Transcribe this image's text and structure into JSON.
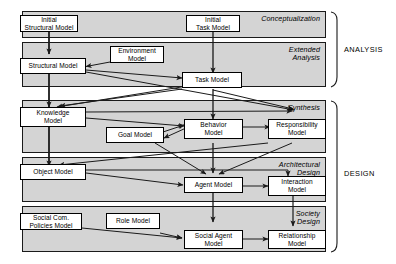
{
  "diagram": {
    "canvas": {
      "width": 396,
      "height": 264
    },
    "colors": {
      "band_fill": "#d4d4d4",
      "band_stroke": "#1a1a1a",
      "node_fill": "#ffffff",
      "node_stroke": "#000000",
      "arrow": "#1a1a1a",
      "background": "#ffffff"
    },
    "groups": [
      {
        "id": "analysis",
        "label": "ANALYSIS"
      },
      {
        "id": "design",
        "label": "DESIGN"
      }
    ],
    "phases": [
      {
        "id": "conceptualization",
        "label": "Conceptualization",
        "group": "analysis"
      },
      {
        "id": "extended-analysis",
        "label": "Extended\nAnalysis",
        "group": "analysis"
      },
      {
        "id": "synthesis",
        "label": "Synthesis",
        "group": "design"
      },
      {
        "id": "architectural-design",
        "label": "Architectural\nDesign",
        "group": "design"
      },
      {
        "id": "society-design",
        "label": "Society\nDesign",
        "group": "design"
      }
    ],
    "nodes": [
      {
        "id": "initial-structural-model",
        "label": "Initial\nStructural Model",
        "phase": "conceptualization"
      },
      {
        "id": "initial-task-model",
        "label": "Initial\nTask Model",
        "phase": "conceptualization"
      },
      {
        "id": "structural-model",
        "label": "Structural Model",
        "phase": "extended-analysis"
      },
      {
        "id": "environment-model",
        "label": "Environment\nModel",
        "phase": "extended-analysis"
      },
      {
        "id": "task-model",
        "label": "Task Model",
        "phase": "extended-analysis"
      },
      {
        "id": "knowledge-model",
        "label": "Knowledge\nModel",
        "phase": "synthesis"
      },
      {
        "id": "goal-model",
        "label": "Goal Model",
        "phase": "synthesis"
      },
      {
        "id": "behavior-model",
        "label": "Behavior\nModel",
        "phase": "synthesis"
      },
      {
        "id": "responsibility-model",
        "label": "Responsibility\nModel",
        "phase": "synthesis"
      },
      {
        "id": "object-model",
        "label": "Object Model",
        "phase": "architectural-design"
      },
      {
        "id": "agent-model",
        "label": "Agent Model",
        "phase": "architectural-design"
      },
      {
        "id": "interaction-model",
        "label": "Interaction\nModel",
        "phase": "architectural-design"
      },
      {
        "id": "social-com-policies-model",
        "label": "Social Com.\nPolicies Model",
        "phase": "society-design"
      },
      {
        "id": "role-model",
        "label": "Role Model",
        "phase": "society-design"
      },
      {
        "id": "social-agent-model",
        "label": "Social Agent\nModel",
        "phase": "society-design"
      },
      {
        "id": "relationship-model",
        "label": "Relationship\nModel",
        "phase": "society-design"
      }
    ],
    "edges": [
      {
        "from": "initial-structural-model",
        "to": "structural-model"
      },
      {
        "from": "initial-task-model",
        "to": "task-model"
      },
      {
        "from": "environment-model",
        "to": "structural-model"
      },
      {
        "from": "structural-model",
        "to": "task-model"
      },
      {
        "from": "structural-model",
        "to": "knowledge-model"
      },
      {
        "from": "structural-model",
        "to": "responsibility-model"
      },
      {
        "from": "task-model",
        "to": "knowledge-model"
      },
      {
        "from": "task-model",
        "to": "responsibility-model"
      },
      {
        "from": "task-model",
        "to": "behavior-model"
      },
      {
        "from": "knowledge-model",
        "to": "responsibility-model"
      },
      {
        "from": "knowledge-model",
        "to": "behavior-model"
      },
      {
        "from": "knowledge-model",
        "to": "object-model"
      },
      {
        "from": "goal-model",
        "to": "behavior-model"
      },
      {
        "from": "behavior-model",
        "to": "goal-model"
      },
      {
        "from": "behavior-model",
        "to": "responsibility-model"
      },
      {
        "from": "behavior-model",
        "to": "agent-model"
      },
      {
        "from": "goal-model",
        "to": "agent-model"
      },
      {
        "from": "responsibility-model",
        "to": "agent-model"
      },
      {
        "from": "responsibility-model",
        "to": "object-model"
      },
      {
        "from": "object-model",
        "to": "agent-model"
      },
      {
        "from": "object-model",
        "to": "interaction-model"
      },
      {
        "from": "agent-model",
        "to": "interaction-model"
      },
      {
        "from": "agent-model",
        "to": "social-agent-model"
      },
      {
        "from": "interaction-model",
        "to": "relationship-model"
      },
      {
        "from": "social-com-policies-model",
        "to": "social-agent-model"
      },
      {
        "from": "role-model",
        "to": "social-agent-model"
      },
      {
        "from": "social-agent-model",
        "to": "relationship-model"
      }
    ]
  }
}
